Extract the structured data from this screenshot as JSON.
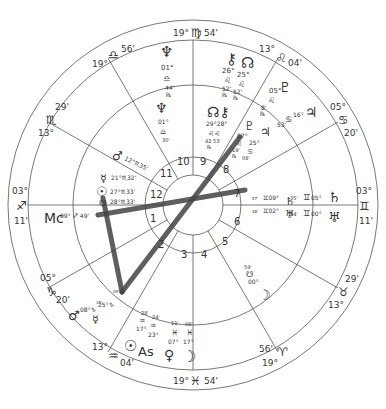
{
  "chart": {
    "center": [
      193,
      205
    ],
    "radii": {
      "outer": 185,
      "zodiac_inner": 165,
      "middle": 120,
      "house_outer": 48,
      "house_inner": 30
    },
    "line_color": "#555555",
    "aspect_color": "#444444"
  },
  "cusps": {
    "top": {
      "deg": "19°",
      "sign": "♍",
      "min": "54'"
    },
    "bottom": {
      "deg": "19°",
      "sign": "♓",
      "min": "54'"
    },
    "left": {
      "deg": "03°",
      "sign": "♐",
      "min": "11'"
    },
    "right": {
      "deg": "03°",
      "sign": "♊",
      "min": "11'"
    },
    "upper_left": {
      "deg": "19°",
      "sign": "♎",
      "min": "56'"
    },
    "left_upper": {
      "deg": "13°",
      "sign": "♏",
      "min": "29'"
    },
    "left_lower": {
      "deg": "05°",
      "sign": "♑",
      "min": "20'"
    },
    "lower_left": {
      "deg": "13°",
      "sign": "♒",
      "min": "04'"
    },
    "upper_right": {
      "deg": "13°",
      "sign": "♌",
      "min": "04'"
    },
    "right_upper": {
      "deg": "05°",
      "sign": "♋",
      "min": "20'"
    },
    "right_lower": {
      "deg": "13°",
      "sign": "♉",
      "min": "29'"
    },
    "lower_right": {
      "deg": "19°",
      "sign": "♈",
      "min": "56'"
    }
  },
  "houses": [
    "1",
    "2",
    "3",
    "4",
    "5",
    "6",
    "7",
    "8",
    "9",
    "10",
    "11",
    "12"
  ],
  "outer_planets": {
    "neptune": {
      "glyph": "♆",
      "deg": "01°",
      "sign": "♎",
      "min": "44'",
      "retro": "℞"
    },
    "chiron": {
      "glyph": "⚷",
      "deg": "26°",
      "sign": "♌",
      "min": "52'",
      "retro": "℞"
    },
    "node": {
      "glyph": "☊",
      "deg": "25°",
      "sign": "♌",
      "min": "52'",
      "retro": "℞"
    },
    "pluto": {
      "glyph": "♇",
      "deg": "05°",
      "sign": "♌",
      "min": "8'",
      "retro": "℞"
    },
    "jupiter": {
      "glyph": "♃",
      "deg": "16°",
      "sign": "♋",
      "min": "53'",
      "retro": "℞"
    },
    "saturn": {
      "glyph": "♄",
      "deg": "05°",
      "sign": "♊",
      "min": "35'"
    },
    "uranus": {
      "glyph": "♅",
      "deg": "00°",
      "sign": "♊",
      "min": "34'"
    }
  },
  "inner_planets": {
    "neptune": {
      "glyph": "♆",
      "deg": "01°",
      "sign": "♎",
      "min": "30'"
    },
    "node_chiron": {
      "glyph": "☊⚷",
      "deg": "29°28°",
      "sign": "♌♌",
      "min": "42 53'",
      "retro": "℞"
    },
    "pluto": {
      "glyph": "♇",
      "deg": "07°",
      "sign": "♌",
      "min": "19'",
      "retro": "℞"
    },
    "jupiter": {
      "glyph": "♃",
      "deg": "25°",
      "sign": "♋",
      "min": "08'",
      "retro": "℞"
    },
    "mars": {
      "glyph": "♂",
      "text": "12°♏35'"
    },
    "mercury": {
      "glyph": "☿",
      "text": "21°♏32'"
    },
    "sun": {
      "glyph": "☉",
      "text": "27°♏33'"
    },
    "moon_node": {
      "glyph": "☋",
      "text": "28°♏33'"
    },
    "mc": {
      "label": "Mc",
      "text": "09° ♐ 49'"
    },
    "saturn7": {
      "glyph": "♄",
      "text": "♊09°",
      "min": "57'"
    },
    "uranus7": {
      "glyph": "♅",
      "text": "♊02°",
      "min": "48'"
    },
    "south_node": {
      "glyph": "☋",
      "deg": "00°",
      "min": "59'"
    },
    "moon": {
      "glyph": "☽"
    },
    "mars2": {
      "glyph": "♂",
      "text": "08°♑",
      "min": "15'"
    },
    "mercury2": {
      "glyph": "☿",
      "text": "25°♑",
      "min": "09'"
    },
    "sun_as": {
      "glyph": "☉",
      "label": "As"
    },
    "aq1": {
      "min": "28'",
      "sign": "♒",
      "deg": "17°"
    },
    "aq2": {
      "min": "24'",
      "sign": "♒",
      "deg": "23°"
    },
    "pi1": {
      "min": "11'",
      "sign": "♓",
      "deg": "07°"
    },
    "pi2": {
      "min": "08'",
      "sign": "♓",
      "deg": "17°"
    },
    "venus": {
      "glyph": "♀"
    },
    "moon2": {
      "glyph": "☽"
    }
  }
}
